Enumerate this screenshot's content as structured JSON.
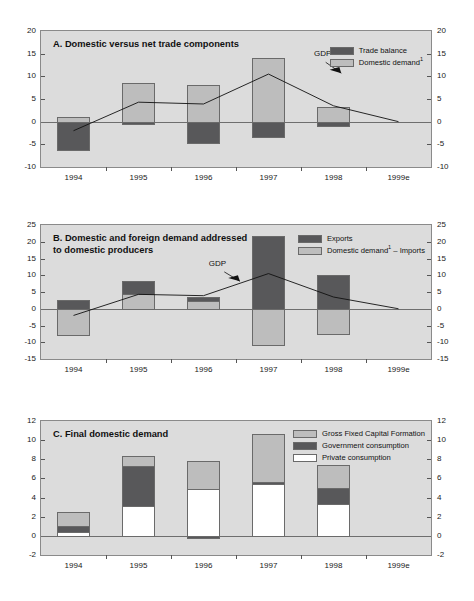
{
  "figure": {
    "background": "#ffffff",
    "plot_background": "#dcdcdc",
    "colors": {
      "dark": "#58585a",
      "light": "#bdbdbd",
      "white": "#ffffff",
      "line": "#111111",
      "frame": "#8a8a8a"
    }
  },
  "chart_data": [
    {
      "id": "panel-a",
      "type": "bar",
      "title": "A.  Domestic versus net trade components",
      "panel_letter": "A.",
      "panel_name": "Domestic versus net trade components",
      "xlabel": "",
      "ylabel": "",
      "ylim": [
        -10,
        20
      ],
      "yticks": [
        20,
        15,
        10,
        5,
        0,
        -5,
        -10
      ],
      "ytick_labels": [
        "20",
        "15",
        "10",
        "5",
        "0",
        "-5",
        "-10"
      ],
      "grid": false,
      "legend_position": "top-right",
      "categories": [
        "1994",
        "1995",
        "1996",
        "1997",
        "1998",
        "1999e"
      ],
      "stacked": true,
      "series": [
        {
          "name": "Domestic demand¹",
          "color": "#bdbdbd",
          "values": [
            1.0,
            8.5,
            8.0,
            14.0,
            3.2,
            null
          ]
        },
        {
          "name": "Trade balance",
          "color": "#58585a",
          "values": [
            -6.2,
            -0.5,
            -4.6,
            -3.3,
            -0.9,
            null
          ]
        }
      ],
      "overlay_line": {
        "name": "GDP",
        "annotation": "GDP",
        "color": "#111111",
        "x": [
          "1994",
          "1995",
          "1996",
          "1997",
          "1998",
          "1999e"
        ],
        "values": [
          -2.0,
          4.3,
          3.9,
          10.5,
          3.5,
          0.0
        ]
      },
      "legend": [
        {
          "label": "Trade balance",
          "color": "#58585a"
        },
        {
          "label": "Domestic demand¹",
          "color": "#bdbdbd"
        }
      ]
    },
    {
      "id": "panel-b",
      "type": "bar",
      "title": "B.  Domestic and foreign demand addressed to domestic producers",
      "panel_letter": "B.",
      "panel_name": "Domestic and foreign demand addressed\nto domestic producers",
      "xlabel": "",
      "ylabel": "",
      "ylim": [
        -15,
        25
      ],
      "yticks": [
        25,
        20,
        15,
        10,
        5,
        0,
        -5,
        -10,
        -15
      ],
      "ytick_labels": [
        "25",
        "20",
        "15",
        "10",
        "5",
        "0",
        "-5",
        "-10",
        "-15"
      ],
      "grid": false,
      "legend_position": "top-right",
      "categories": [
        "1994",
        "1995",
        "1996",
        "1997",
        "1998",
        "1999e"
      ],
      "stacked": true,
      "series": [
        {
          "name": "Exports",
          "color": "#58585a",
          "values": [
            2.5,
            3.9,
            1.4,
            21.6,
            10.1,
            null
          ]
        },
        {
          "name": "Domestic demand¹ – Imports",
          "color": "#bdbdbd",
          "values": [
            -7.8,
            4.3,
            2.2,
            -10.8,
            -7.5,
            null
          ]
        }
      ],
      "series_tops": {
        "exports_top": [
          2.5,
          8.2,
          3.6,
          21.6,
          10.1,
          null
        ],
        "dd_imports": [
          -7.8,
          4.3,
          2.2,
          -10.8,
          -7.5,
          null
        ]
      },
      "overlay_line": {
        "name": "GDP",
        "annotation": "GDP",
        "color": "#111111",
        "x": [
          "1994",
          "1995",
          "1996",
          "1997",
          "1998",
          "1999e"
        ],
        "values": [
          -2.0,
          4.3,
          3.9,
          10.5,
          3.5,
          0.0
        ]
      },
      "legend": [
        {
          "label": "Exports",
          "color": "#58585a"
        },
        {
          "label": "Domestic demand¹ – Imports",
          "color": "#bdbdbd"
        }
      ]
    },
    {
      "id": "panel-c",
      "type": "bar",
      "title": "C.  Final domestic demand",
      "panel_letter": "C.",
      "panel_name": "Final domestic demand",
      "xlabel": "",
      "ylabel": "",
      "ylim": [
        -2,
        12
      ],
      "yticks": [
        12,
        10,
        8,
        6,
        4,
        2,
        0,
        -2
      ],
      "ytick_labels": [
        "12",
        "10",
        "8",
        "6",
        "4",
        "2",
        "0",
        "-2"
      ],
      "grid": false,
      "legend_position": "top-right",
      "categories": [
        "1994",
        "1995",
        "1996",
        "1997",
        "1998",
        "1999e"
      ],
      "stacked": true,
      "series": [
        {
          "name": "Private consumption",
          "color": "#ffffff",
          "values": [
            0.4,
            3.1,
            4.85,
            5.4,
            3.3,
            null
          ]
        },
        {
          "name": "Government consumption",
          "color": "#58585a",
          "values": [
            0.6,
            4.2,
            -0.25,
            0.2,
            1.7,
            null
          ]
        },
        {
          "name": "Gross Fixed Capital Formation",
          "color": "#bdbdbd",
          "values": [
            1.45,
            1.05,
            2.95,
            5.0,
            2.4,
            null
          ]
        }
      ],
      "cumulative_tops": {
        "private": [
          0.4,
          3.1,
          4.85,
          5.4,
          3.3,
          null
        ],
        "government": [
          1.0,
          7.3,
          -0.25,
          5.6,
          5.0,
          null
        ],
        "total": [
          2.45,
          8.35,
          7.8,
          10.6,
          7.4,
          null
        ]
      },
      "legend": [
        {
          "label": "Gross Fixed Capital Formation",
          "color": "#bdbdbd"
        },
        {
          "label": "Government consumption",
          "color": "#58585a"
        },
        {
          "label": "Private consumption",
          "color": "#ffffff"
        }
      ]
    }
  ]
}
